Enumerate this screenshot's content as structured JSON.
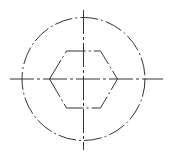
{
  "drawing": {
    "title": "",
    "stroke_color": "#333333",
    "background": "#ffffff",
    "center": {
      "x": 83.5,
      "y": 79
    },
    "circle": {
      "r": 61.5,
      "dash": "18 3 2 3"
    },
    "hexagon": {
      "points": "49.5,79 66.5,51 100.5,51 117.5,79 100.5,108 66.5,108",
      "dash": "22 3 2 3"
    },
    "centerline_h": {
      "x1": 10,
      "x2": 163,
      "y": 79,
      "dash": "24 3 3 3"
    },
    "centerline_v": {
      "x": 83.5,
      "y1": 10,
      "y2": 150,
      "dash": "24 3 3 3"
    }
  }
}
